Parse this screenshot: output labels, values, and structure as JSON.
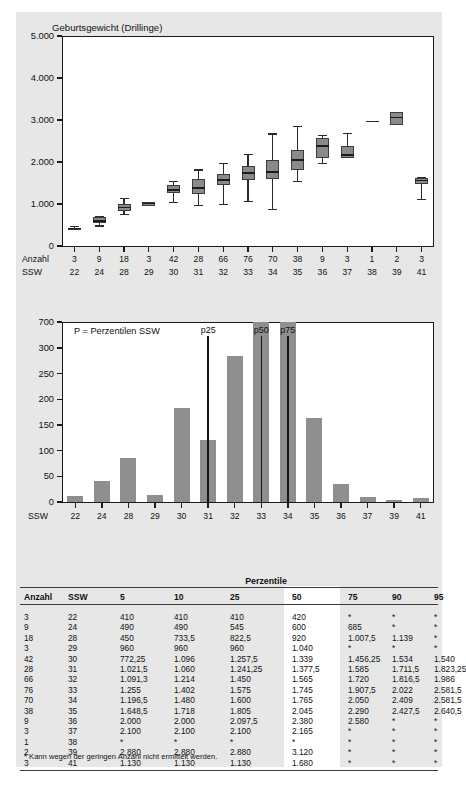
{
  "chart_data": [
    {
      "type": "box",
      "title": "Geburtsgewicht (Drillinge)",
      "xlabel": "SSW",
      "ylabel": "",
      "ylim": [
        0,
        5000
      ],
      "yticks": [
        "0",
        "1.000",
        "2.000",
        "3.000",
        "4.000",
        "5.000"
      ],
      "ytick_values": [
        0,
        1000,
        2000,
        3000,
        4000,
        5000
      ],
      "row_labels": [
        "Anzahl",
        "SSW"
      ],
      "categories": [
        "22",
        "24",
        "28",
        "29",
        "30",
        "31",
        "32",
        "33",
        "34",
        "35",
        "36",
        "37",
        "38",
        "39",
        "41"
      ],
      "counts": [
        "3",
        "9",
        "18",
        "3",
        "42",
        "28",
        "66",
        "76",
        "70",
        "38",
        "9",
        "3",
        "1",
        "2",
        "3"
      ],
      "boxes": [
        {
          "ssw": "22",
          "n": 3,
          "low": 410,
          "q1": 410,
          "med": 420,
          "q3": 440,
          "high": 470
        },
        {
          "ssw": "24",
          "n": 9,
          "low": 490,
          "q1": 545,
          "med": 600,
          "q3": 685,
          "high": 720
        },
        {
          "ssw": "28",
          "n": 18,
          "low": 760,
          "q1": 822,
          "med": 920,
          "q3": 1008,
          "high": 1139
        },
        {
          "ssw": "29",
          "n": 3,
          "low": 960,
          "q1": 960,
          "med": 1010,
          "q3": 1040,
          "high": 1040
        },
        {
          "ssw": "30",
          "n": 42,
          "low": 1050,
          "q1": 1258,
          "med": 1339,
          "q3": 1456,
          "high": 1540
        },
        {
          "ssw": "31",
          "n": 28,
          "low": 970,
          "q1": 1241,
          "med": 1378,
          "q3": 1585,
          "high": 1823
        },
        {
          "ssw": "32",
          "n": 66,
          "low": 1010,
          "q1": 1450,
          "med": 1565,
          "q3": 1720,
          "high": 1986
        },
        {
          "ssw": "33",
          "n": 76,
          "low": 1070,
          "q1": 1575,
          "med": 1745,
          "q3": 1908,
          "high": 2200
        },
        {
          "ssw": "34",
          "n": 70,
          "low": 880,
          "q1": 1600,
          "med": 1765,
          "q3": 2050,
          "high": 2680
        },
        {
          "ssw": "35",
          "n": 38,
          "low": 1540,
          "q1": 1805,
          "med": 2045,
          "q3": 2290,
          "high": 2860
        },
        {
          "ssw": "36",
          "n": 9,
          "low": 1980,
          "q1": 2098,
          "med": 2380,
          "q3": 2580,
          "high": 2640
        },
        {
          "ssw": "37",
          "n": 3,
          "low": 2100,
          "q1": 2100,
          "med": 2165,
          "q3": 2380,
          "high": 2700
        },
        {
          "ssw": "38",
          "n": 1,
          "low": 2960,
          "q1": 2960,
          "med": 2960,
          "q3": 2960,
          "high": 2960
        },
        {
          "ssw": "39",
          "n": 2,
          "low": 2880,
          "q1": 2880,
          "med": 3060,
          "q3": 3200,
          "high": 3200
        },
        {
          "ssw": "41",
          "n": 3,
          "low": 1130,
          "q1": 1470,
          "med": 1560,
          "q3": 1620,
          "high": 1640
        }
      ]
    },
    {
      "type": "bar",
      "title": "",
      "legend_note": "P = Perzentilen SSW",
      "xlabel": "SSW",
      "ylabel": "",
      "axis_break": true,
      "yticks": [
        "0",
        "50",
        "100",
        "150",
        "200",
        "250",
        "300",
        "700"
      ],
      "ytick_values": [
        0,
        50,
        100,
        150,
        200,
        250,
        300,
        700
      ],
      "categories": [
        "22",
        "24",
        "28",
        "29",
        "30",
        "31",
        "32",
        "33",
        "34",
        "35",
        "36",
        "37",
        "39",
        "41"
      ],
      "values": [
        12,
        40,
        85,
        13,
        183,
        120,
        285,
        348,
        303,
        163,
        36,
        9,
        3,
        7
      ],
      "percentile_markers": [
        {
          "label": "p25",
          "ssw": "31"
        },
        {
          "label": "p50",
          "ssw": "33"
        },
        {
          "label": "p75",
          "ssw": "34"
        }
      ]
    }
  ],
  "table": {
    "group_header": "Perzentile",
    "columns": [
      "Anzahl",
      "SSW",
      "5",
      "10",
      "25",
      "50",
      "75",
      "90",
      "95"
    ],
    "rows": [
      [
        "3",
        "22",
        "410",
        "410",
        "410",
        "420",
        "*",
        "*",
        "*"
      ],
      [
        "9",
        "24",
        "490",
        "490",
        "545",
        "600",
        "685",
        "*",
        "*"
      ],
      [
        "18",
        "28",
        "450",
        "733,5",
        "822,5",
        "920",
        "1.007,5",
        "1.139",
        "*"
      ],
      [
        "3",
        "29",
        "960",
        "960",
        "960",
        "1.040",
        "*",
        "*",
        "*"
      ],
      [
        "42",
        "30",
        "772,25",
        "1.096",
        "1.257,5",
        "1.339",
        "1.456,25",
        "1.534",
        "1.540"
      ],
      [
        "28",
        "31",
        "1.021,5",
        "1.060",
        "1.241,25",
        "1.377,5",
        "1.585",
        "1.711,5",
        "1.823,25"
      ],
      [
        "66",
        "32",
        "1.091,3",
        "1.214",
        "1.450",
        "1.565",
        "1.720",
        "1.816,5",
        "1.986"
      ],
      [
        "76",
        "33",
        "1.255",
        "1.402",
        "1.575",
        "1.745",
        "1.907,5",
        "2.022",
        "2.581,5"
      ],
      [
        "70",
        "34",
        "1.196,5",
        "1.480",
        "1.600",
        "1.765",
        "2.050",
        "2.409",
        "2.581,5"
      ],
      [
        "38",
        "35",
        "1.648,5",
        "1.718",
        "1.805",
        "2.045",
        "2.290",
        "2.427,5",
        "2.640,5"
      ],
      [
        "9",
        "36",
        "2.000",
        "2.000",
        "2.097,5",
        "2.380",
        "2.580",
        "*",
        "*"
      ],
      [
        "3",
        "37",
        "2.100",
        "2.100",
        "2.100",
        "2.165",
        "*",
        "*",
        "*"
      ],
      [
        "1",
        "38",
        "*",
        "*",
        "*",
        "*",
        "*",
        "*",
        "*"
      ],
      [
        "2",
        "39",
        "2.880",
        "2.880",
        "2.880",
        "3.120",
        "*",
        "*",
        "*"
      ],
      [
        "3",
        "41",
        "1.130",
        "1.130",
        "1.130",
        "1.680",
        "*",
        "*",
        "*"
      ]
    ],
    "footnote": "* Kann wegen der geringen Anzahl nicht ermittelt werden."
  },
  "colors": {
    "page_bg": "#e7e7e7",
    "plot_bg": "#ffffff",
    "box_fill": "#8a8a8a",
    "bar_fill": "#8f8f8f",
    "axis": "#1a1a1a",
    "marker_line": "#141414"
  }
}
